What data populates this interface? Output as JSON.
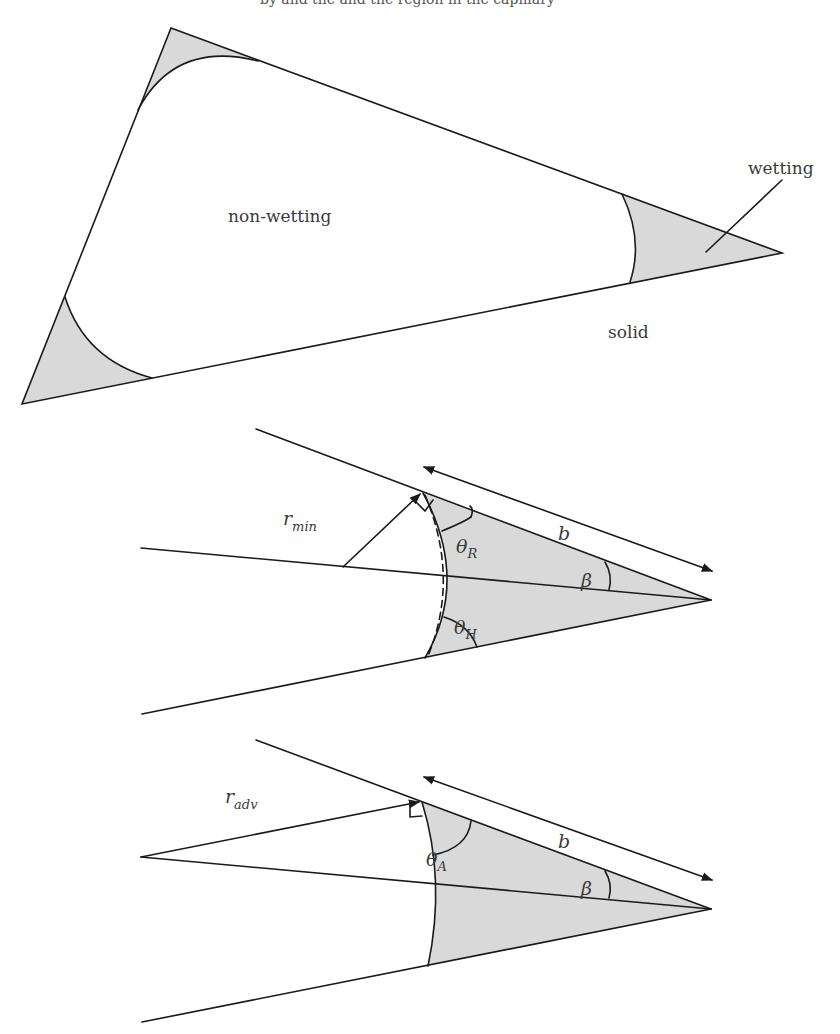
{
  "header": {
    "cut_text": "by and the and the region in the capillary"
  },
  "top_figure": {
    "labels": {
      "non_wetting": "non-wetting",
      "wetting": "wetting",
      "solid": "solid"
    },
    "fill_color": "#d9d9d9",
    "line_color": "#1a1a1a"
  },
  "middle_figure": {
    "labels": {
      "radius_main": "r",
      "radius_sub": "min",
      "b": "b",
      "theta_r_main": "θ",
      "theta_r_sub": "R",
      "theta_h_main": "θ",
      "theta_h_sub": "H",
      "beta": "β"
    }
  },
  "bottom_figure": {
    "labels": {
      "radius_main": "r",
      "radius_sub": "adv",
      "b": "b",
      "theta_a_main": "θ",
      "theta_a_sub": "A",
      "beta": "β"
    }
  }
}
